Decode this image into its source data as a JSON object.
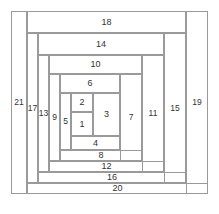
{
  "diagram": {
    "type": "log-cabin-quilt-block",
    "title": "",
    "stroke_color": "#9a9a9a",
    "label_color": "#333333",
    "background": "#ffffff",
    "canvas": {
      "width": 219,
      "height": 214
    },
    "pieces": [
      {
        "label": "1",
        "x": 71,
        "y": 112,
        "w": 22,
        "h": 24,
        "orient": "center"
      },
      {
        "label": "2",
        "x": 71,
        "y": 93,
        "w": 22,
        "h": 19,
        "orient": "horizontal"
      },
      {
        "label": "3",
        "x": 93,
        "y": 93,
        "w": 27,
        "h": 43,
        "orient": "vertical"
      },
      {
        "label": "4",
        "x": 71,
        "y": 136,
        "w": 49,
        "h": 14,
        "orient": "horizontal"
      },
      {
        "label": "5",
        "x": 60,
        "y": 93,
        "w": 11,
        "h": 57,
        "orient": "vertical"
      },
      {
        "label": "6",
        "x": 60,
        "y": 74,
        "w": 60,
        "h": 19,
        "orient": "horizontal"
      },
      {
        "label": "7",
        "x": 120,
        "y": 74,
        "w": 22,
        "h": 87,
        "orient": "vertical"
      },
      {
        "label": "8",
        "x": 60,
        "y": 150,
        "w": 82,
        "h": 11,
        "orient": "horizontal"
      },
      {
        "label": "9",
        "x": 49,
        "y": 74,
        "w": 11,
        "h": 87,
        "orient": "vertical"
      },
      {
        "label": "10",
        "x": 49,
        "y": 55,
        "w": 93,
        "h": 19,
        "orient": "horizontal"
      },
      {
        "label": "11",
        "x": 142,
        "y": 55,
        "w": 22,
        "h": 117,
        "orient": "vertical"
      },
      {
        "label": "12",
        "x": 49,
        "y": 161,
        "w": 115,
        "h": 11,
        "orient": "horizontal"
      },
      {
        "label": "13",
        "x": 38,
        "y": 55,
        "w": 11,
        "h": 117,
        "orient": "vertical"
      },
      {
        "label": "14",
        "x": 38,
        "y": 33,
        "w": 126,
        "h": 22,
        "orient": "horizontal"
      },
      {
        "label": "15",
        "x": 164,
        "y": 33,
        "w": 22,
        "h": 150,
        "orient": "vertical"
      },
      {
        "label": "16",
        "x": 38,
        "y": 172,
        "w": 148,
        "h": 11,
        "orient": "horizontal"
      },
      {
        "label": "17",
        "x": 27,
        "y": 33,
        "w": 11,
        "h": 150,
        "orient": "vertical"
      },
      {
        "label": "18",
        "x": 27,
        "y": 11,
        "w": 159,
        "h": 22,
        "orient": "horizontal"
      },
      {
        "label": "19",
        "x": 186,
        "y": 11,
        "w": 22,
        "h": 183,
        "orient": "vertical"
      },
      {
        "label": "20",
        "x": 27,
        "y": 183,
        "w": 181,
        "h": 11,
        "orient": "horizontal"
      },
      {
        "label": "21",
        "x": 11,
        "y": 11,
        "w": 16,
        "h": 183,
        "orient": "vertical"
      }
    ]
  }
}
